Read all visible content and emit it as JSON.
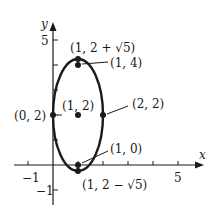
{
  "diagram": {
    "type": "ellipse-graph",
    "axes": {
      "x_label": "x",
      "y_label": "y",
      "x_ticks": [
        {
          "value": -1,
          "label": "−1"
        },
        {
          "value": 5,
          "label": "5"
        }
      ],
      "y_ticks": [
        {
          "value": 5,
          "label": "5"
        },
        {
          "value": -1,
          "label": "−1"
        }
      ]
    },
    "ellipse": {
      "center": [
        1,
        2
      ],
      "semi_axis_x": 1,
      "semi_axis_y": 2.236,
      "stroke": "#1a1a1a"
    },
    "points": [
      {
        "id": "top-vertex",
        "label": "(1, 2 + √5)",
        "x": 1,
        "y": 4.236
      },
      {
        "id": "focus-upper",
        "label": "(1, 4)",
        "x": 1,
        "y": 4
      },
      {
        "id": "center",
        "label": "(1, 2)",
        "x": 1,
        "y": 2
      },
      {
        "id": "right-covertex",
        "label": "(2, 2)",
        "x": 2,
        "y": 2
      },
      {
        "id": "left-covertex",
        "label": "(0, 2)",
        "x": 0,
        "y": 2
      },
      {
        "id": "focus-lower",
        "label": "(1, 0)",
        "x": 1,
        "y": 0
      },
      {
        "id": "bottom-vertex",
        "label": "(1, 2 − √5)",
        "x": 1,
        "y": -0.236
      }
    ]
  }
}
